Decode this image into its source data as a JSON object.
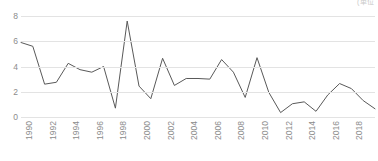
{
  "unit_caption": "(単位",
  "chart_data": {
    "type": "line",
    "title": "",
    "subtitle": "",
    "xlabel": "",
    "ylabel": "",
    "x": [
      1990,
      1991,
      1992,
      1993,
      1994,
      1995,
      1996,
      1997,
      1998,
      1999,
      2000,
      2001,
      2002,
      2003,
      2004,
      2005,
      2006,
      2007,
      2008,
      2009,
      2010,
      2011,
      2012,
      2013,
      2014,
      2015,
      2016,
      2017,
      2018,
      2019,
      2020
    ],
    "values": [
      5.9,
      5.6,
      2.6,
      2.75,
      4.25,
      3.75,
      3.55,
      4.0,
      0.7,
      7.6,
      2.45,
      1.45,
      4.65,
      2.5,
      3.05,
      3.05,
      3.0,
      4.55,
      3.55,
      1.55,
      4.7,
      1.95,
      0.35,
      1.05,
      1.2,
      0.45,
      1.75,
      2.65,
      2.25,
      1.3,
      0.65
    ],
    "series": [
      {
        "name": "",
        "color": "#595959",
        "values": [
          5.9,
          5.6,
          2.6,
          2.75,
          4.25,
          3.75,
          3.55,
          4.0,
          0.7,
          7.6,
          2.45,
          1.45,
          4.65,
          2.5,
          3.05,
          3.05,
          3.0,
          4.55,
          3.55,
          1.55,
          4.7,
          1.95,
          0.35,
          1.05,
          1.2,
          0.45,
          1.75,
          2.65,
          2.25,
          1.3,
          0.65
        ]
      }
    ],
    "ylim": [
      0,
      8
    ],
    "xlim": [
      1990,
      2020
    ],
    "yticks": [
      0,
      2,
      4,
      6,
      8
    ],
    "ytick_labels": [
      "0",
      "2",
      "4",
      "6",
      "8"
    ],
    "xticks": [
      1990,
      1992,
      1994,
      1996,
      1998,
      2000,
      2002,
      2004,
      2006,
      2008,
      2010,
      2012,
      2014,
      2016,
      2018,
      2020
    ],
    "xtick_labels": [
      "1990",
      "1992",
      "1994",
      "1996",
      "1998",
      "2000",
      "2002",
      "2004",
      "2006",
      "2008",
      "2010",
      "2012",
      "2014",
      "2016",
      "2018",
      "2020"
    ],
    "grid": true,
    "grid_axis": "y",
    "grid_color": "#e3e3e3",
    "legend": false,
    "legend_position": "none",
    "xtick_rotation": -90,
    "line_color": "#595959",
    "line_width": 1,
    "markers": false,
    "background_color": "#ffffff",
    "tick_label_color": "#8c8c8c"
  }
}
